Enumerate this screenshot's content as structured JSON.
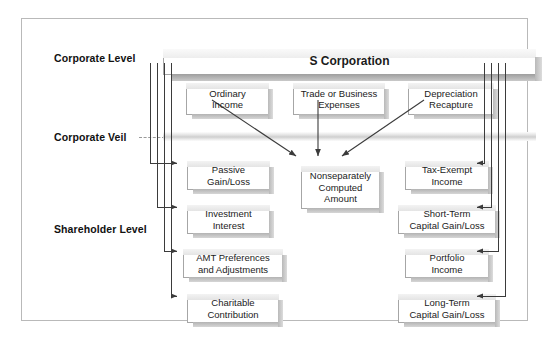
{
  "diagram": {
    "levels": [
      {
        "id": "corporate-level",
        "label": "Corporate Level"
      },
      {
        "id": "corporate-veil",
        "label": "Corporate Veil"
      },
      {
        "id": "shareholder-level",
        "label": "Shareholder Level"
      }
    ],
    "root": {
      "id": "s-corporation",
      "label": "S Corporation"
    },
    "corporate_items": [
      {
        "id": "ordinary-income",
        "label": "Ordinary\nIncome"
      },
      {
        "id": "trade-or-business-expenses",
        "label": "Trade or Business\nExpenses"
      },
      {
        "id": "depreciation-recapture",
        "label": "Depreciation\nRecapture"
      }
    ],
    "aggregate": {
      "id": "nonseparately-computed-amount",
      "label": "Nonseparately\nComputed\nAmount"
    },
    "shareholder_left": [
      {
        "id": "passive-gain-loss",
        "label": "Passive\nGain/Loss"
      },
      {
        "id": "investment-interest",
        "label": "Investment\nInterest"
      },
      {
        "id": "amt-preferences-and-adjustments",
        "label": "AMT Preferences\nand Adjustments"
      },
      {
        "id": "charitable-contribution",
        "label": "Charitable\nContribution"
      }
    ],
    "shareholder_right": [
      {
        "id": "tax-exempt-income",
        "label": "Tax-Exempt\nIncome"
      },
      {
        "id": "short-term-capital-gain-loss",
        "label": "Short-Term\nCapital Gain/Loss"
      },
      {
        "id": "portfolio-income",
        "label": "Portfolio\nIncome"
      },
      {
        "id": "long-term-capital-gain-loss",
        "label": "Long-Term\nCapital Gain/Loss"
      }
    ],
    "colors": {
      "frame_border": "#b9b9b9",
      "box_border": "#a6a6a6",
      "box_fill": "#ffffff",
      "shadow": "#b3b3b3",
      "wire": "#3b3b3b",
      "veil_band": "#cfcfcf",
      "text": "#1b1b1b"
    }
  }
}
